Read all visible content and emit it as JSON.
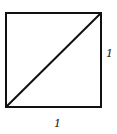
{
  "diagram": {
    "labels": {
      "right_side": "1",
      "bottom_side": "1"
    },
    "stroke_color": "#111111",
    "background": "#ffffff"
  }
}
